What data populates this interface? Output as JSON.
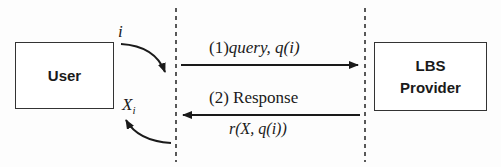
{
  "diagram": {
    "nodes": {
      "user": {
        "label": "User"
      },
      "provider": {
        "line1": "LBS",
        "line2": "Provider"
      }
    },
    "labels": {
      "input": "i",
      "output_var": "X",
      "output_sub": "i",
      "query_num": "(1)",
      "query_text": "query, q(i)",
      "response": "(2) Response",
      "response_expr": "r(X, q(i))"
    },
    "colors": {
      "stroke": "#1a1a1a",
      "box_border": "#333333",
      "background": "#fdfdfd"
    }
  }
}
